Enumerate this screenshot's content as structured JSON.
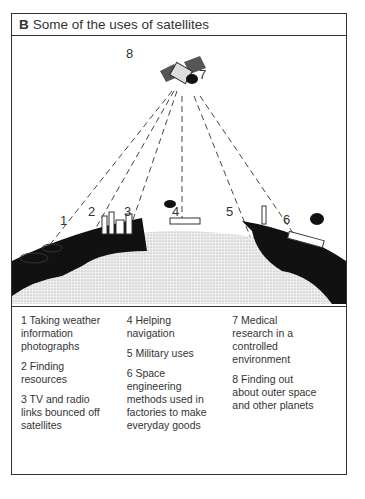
{
  "title": {
    "letter": "B",
    "text": "Some of the uses of satellites"
  },
  "diagram": {
    "labels": [
      "1",
      "2",
      "3",
      "4",
      "5",
      "6",
      "7",
      "8"
    ],
    "icons": [
      "satellite-icon",
      "cloud-icon",
      "mining-site-icon",
      "factory-city-icon",
      "ship-icon",
      "tank-icon",
      "rocket-icon",
      "train-icon",
      "earth-icon"
    ]
  },
  "legend": {
    "col1": [
      "1 Taking weather information photographs",
      "2 Finding resources",
      "3 TV and radio links bounced off satellites"
    ],
    "col2": [
      "4 Helping navigation",
      "5 Military uses",
      "6 Space engineering methods used in factories to make everyday goods"
    ],
    "col3": [
      "7 Medical research in a controlled environment",
      "8 Finding out about outer space and other planets"
    ]
  }
}
